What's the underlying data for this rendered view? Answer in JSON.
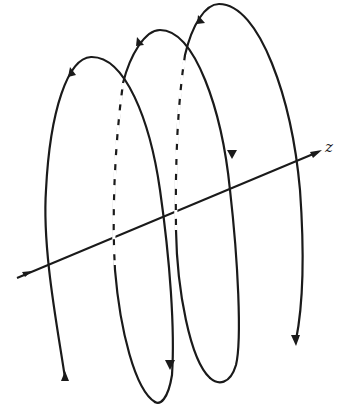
{
  "diagram": {
    "type": "helix",
    "axis": {
      "label": "z"
    },
    "turns": 3,
    "colors": {
      "stroke": "#1a1a1a",
      "background": "#ffffff"
    }
  }
}
